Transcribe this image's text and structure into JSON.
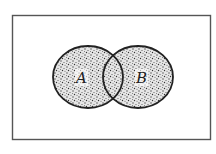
{
  "diagram": {
    "type": "venn",
    "universe": {
      "x": 12,
      "y": 15,
      "width": 198,
      "height": 125,
      "stroke": "#555555"
    },
    "sets": [
      {
        "label": "A",
        "cx": 88,
        "cy": 77,
        "rx": 35,
        "ry": 31
      },
      {
        "label": "B",
        "cx": 138,
        "cy": 77,
        "rx": 35,
        "ry": 31
      }
    ],
    "shading": "stippled",
    "shaded_region": "A ∪ B",
    "colors": {
      "stroke": "#222222",
      "dots": "#444444",
      "background": "#ffffff"
    }
  }
}
